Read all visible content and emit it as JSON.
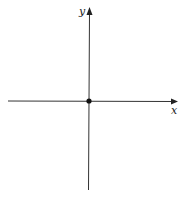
{
  "diagram": {
    "type": "cartesian-axes",
    "axes": {
      "x_label": "x",
      "y_label": "y"
    },
    "origin_point": {
      "marked": true
    },
    "colors": {
      "axis": "#333333",
      "point": "#111111",
      "background": "#ffffff"
    }
  }
}
